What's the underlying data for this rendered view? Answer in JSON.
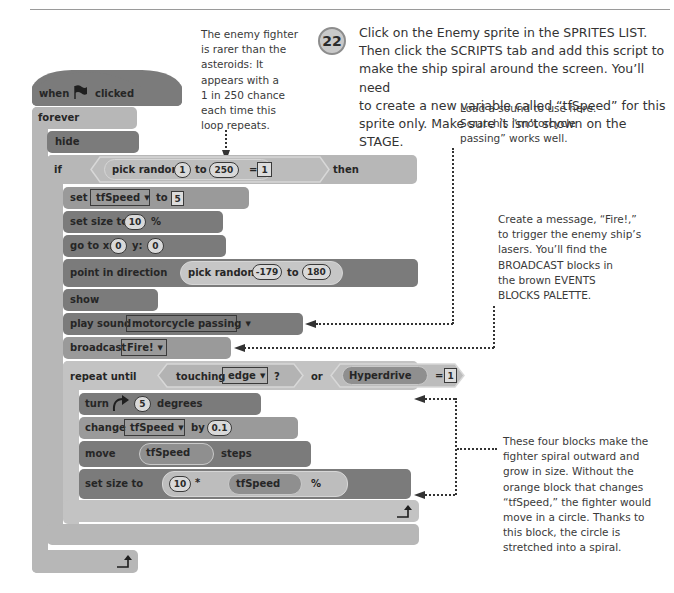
{
  "step": {
    "number": "22",
    "text": "Click on the Enemy sprite in the SPRITES LIST.\nThen click the SCRIPTS tab and add this script to\nmake the ship spiral around the screen. You’ll need\nto create a new variable called “tfSpeed” for this\nsprite only. Make sure it isn’t shown on the STAGE."
  },
  "annotations": {
    "rarity": "The enemy fighter\nis rarer than the\nasteroids: It\nappears with a\n1 in 250 chance\neach time this\nloop repeats.",
    "sound": "Load a sound to use here.\nScratch’s “motorcycle\npassing” works well.",
    "broadcast": "Create a message, “Fire!,”\nto trigger the enemy ship’s\nlasers. You’ll find the\nBROADCAST blocks in\nthe brown EVENTS\nBLOCKS PALETTE.",
    "spiral": "These four blocks make the\nfighter spiral outward and\ngrow in size. Without the\norange block that changes\n“tfSpeed,” the fighter would\nmove in a circle. Thanks to\nthis block, the circle is\nstretched into a spiral."
  },
  "script": {
    "hat": {
      "when": "when",
      "clicked": "clicked",
      "icon": "green-flag-icon"
    },
    "forever": "forever",
    "hide": "hide",
    "if_block": {
      "if": "if",
      "then": "then",
      "pick_random": "pick random",
      "to": "to",
      "from": "1",
      "max": "250",
      "equals": "=",
      "compare": "1"
    },
    "set_var": {
      "set": "set",
      "var": "tfSpeed",
      "to": "to",
      "value": "5"
    },
    "set_size": {
      "label": "set size to",
      "value": "10",
      "unit": "%"
    },
    "go_to": {
      "label": "go to x:",
      "x": "0",
      "y_label": "y:",
      "y": "0"
    },
    "point": {
      "label": "point in direction",
      "pick_random": "pick random",
      "from": "-179",
      "to": "to",
      "max": "180"
    },
    "show": "show",
    "play_sound": {
      "label": "play sound",
      "sound": "motorcycle passing"
    },
    "broadcast": {
      "label": "broadcast",
      "message": "Fire!"
    },
    "repeat_until": {
      "label": "repeat until",
      "touching": "touching",
      "target": "edge",
      "question": "?",
      "or": "or",
      "var": "Hyperdrive",
      "equals": "=",
      "value": "1"
    },
    "turn": {
      "label": "turn",
      "value": "5",
      "unit": "degrees"
    },
    "change": {
      "label": "change",
      "var": "tfSpeed",
      "by": "by",
      "value": "0.1"
    },
    "move": {
      "label": "move",
      "var": "tfSpeed",
      "unit": "steps"
    },
    "set_size2": {
      "label": "set size to",
      "value": "10",
      "times": "*",
      "var": "tfSpeed",
      "unit": "%"
    }
  }
}
